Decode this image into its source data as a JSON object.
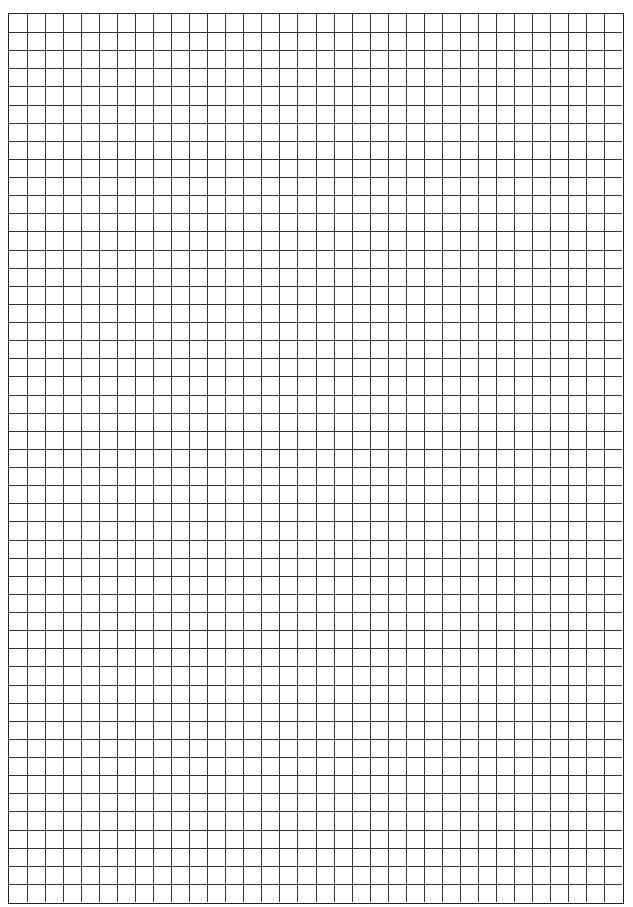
{
  "page": {
    "type": "graph-paper",
    "background": "#ffffff",
    "line_color": "#333333",
    "border_color": "#222222"
  },
  "grid": {
    "columns": 34,
    "rows": 49
  }
}
